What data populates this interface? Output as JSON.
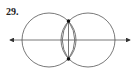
{
  "problem_number": "29.",
  "diagram": {
    "circles": [
      {
        "cx": 49,
        "cy": 40,
        "r": 27
      },
      {
        "cx": 88,
        "cy": 40,
        "r": 27
      }
    ],
    "line": {
      "x1": 8,
      "y1": 40,
      "x2": 132,
      "y2": 40,
      "arrows": "both"
    },
    "chord": {
      "x1": 68.5,
      "y1": 21,
      "x2": 68.5,
      "y2": 59
    },
    "lens_arc": true,
    "points": [
      {
        "x": 68.5,
        "y": 21
      },
      {
        "x": 68.5,
        "y": 59
      }
    ],
    "stroke_color": "#555555"
  }
}
